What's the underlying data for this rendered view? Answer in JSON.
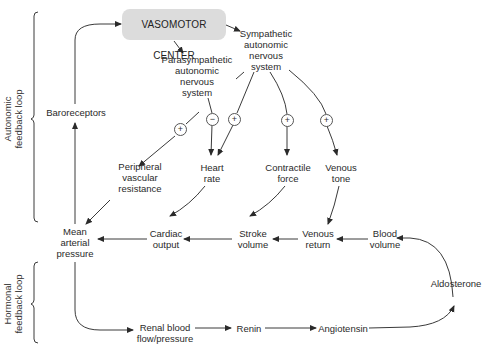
{
  "diagram": {
    "brackets": {
      "autonomic": "Autonomic\nfeedback loop",
      "hormonal": "Hormonal\nfeedback loop"
    },
    "nodes": {
      "vasomotor_center": "VASOMOTOR CENTER",
      "sympathetic": "Sympathetic\nautonomic\nnervous\nsystem",
      "parasympathetic": "Parasympathetic\nautonomic\nnervous\nsystem",
      "baroreceptors": "Baroreceptors",
      "peripheral_vascular_resistance": "Peripheral\nvascular\nresistance",
      "heart_rate": "Heart\nrate",
      "contractile_force": "Contractile\nforce",
      "venous_tone": "Venous\ntone",
      "mean_arterial_pressure": "Mean\narterial\npressure",
      "cardiac_output": "Cardiac\noutput",
      "stroke_volume": "Stroke\nvolume",
      "venous_return": "Venous\nreturn",
      "blood_volume": "Blood\nvolume",
      "aldosterone": "Aldosterone",
      "renal_blood_flow": "Renal blood\nflow/pressure",
      "renin": "Renin",
      "angiotensin": "Angiotensin"
    },
    "signs": {
      "sym_to_pvr": "+",
      "para_to_hr": "−",
      "sym_to_hr": "+",
      "sym_to_contractile": "+",
      "sym_to_venous_tone": "+"
    },
    "colors": {
      "line": "#3a3a3a",
      "vasomotor_fill": "#dcdcdc",
      "text": "#2a2a2a"
    }
  }
}
